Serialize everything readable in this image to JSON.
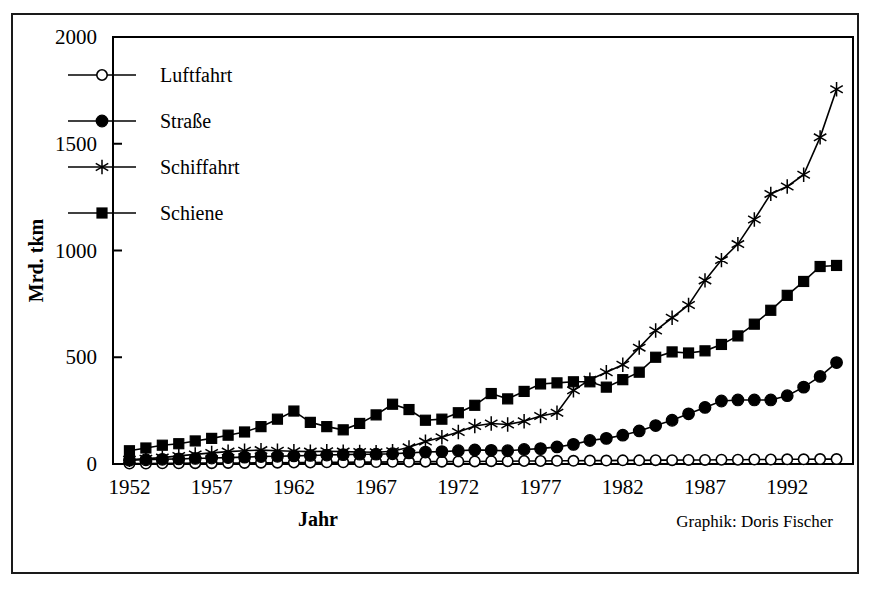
{
  "figure": {
    "credit": "Graphik: Doris Fischer"
  },
  "chart_data": {
    "type": "line",
    "title": "",
    "xlabel": "Jahr",
    "ylabel": "Mrd. tkm",
    "xlim": [
      1951,
      1996
    ],
    "ylim": [
      0,
      2000
    ],
    "xticks": [
      1952,
      1957,
      1962,
      1967,
      1972,
      1977,
      1982,
      1987,
      1992
    ],
    "xticklabels": [
      "1952",
      "1957",
      "1962",
      "1967",
      "1972",
      "1977",
      "1982",
      "1987",
      "1992"
    ],
    "yticks": [
      0,
      500,
      1000,
      1500,
      2000
    ],
    "yticklabels": [
      "0",
      "500",
      "1000",
      "1500",
      "2000"
    ],
    "grid": false,
    "legend_position": "upper left",
    "x": [
      1952,
      1953,
      1954,
      1955,
      1956,
      1957,
      1958,
      1959,
      1960,
      1961,
      1962,
      1963,
      1964,
      1965,
      1966,
      1967,
      1968,
      1969,
      1970,
      1971,
      1972,
      1973,
      1974,
      1975,
      1976,
      1977,
      1978,
      1979,
      1980,
      1981,
      1982,
      1983,
      1984,
      1985,
      1986,
      1987,
      1988,
      1989,
      1990,
      1991,
      1992,
      1993,
      1994,
      1995
    ],
    "series": [
      {
        "name": "Luftfahrt",
        "marker": "open-circle",
        "values": [
          2,
          2,
          3,
          3,
          4,
          4,
          5,
          5,
          6,
          6,
          7,
          7,
          8,
          8,
          9,
          9,
          10,
          10,
          11,
          11,
          12,
          12,
          13,
          13,
          14,
          14,
          15,
          15,
          16,
          16,
          17,
          17,
          18,
          18,
          19,
          19,
          20,
          20,
          21,
          21,
          22,
          22,
          23,
          23
        ]
      },
      {
        "name": "Straße",
        "marker": "filled-circle",
        "values": [
          18,
          20,
          22,
          24,
          26,
          28,
          30,
          32,
          35,
          36,
          38,
          40,
          42,
          44,
          46,
          46,
          48,
          52,
          56,
          58,
          62,
          66,
          64,
          62,
          68,
          72,
          80,
          92,
          110,
          120,
          135,
          155,
          180,
          205,
          235,
          265,
          295,
          300,
          300,
          300,
          320,
          360,
          410,
          475
        ]
      },
      {
        "name": "Schiffahrt",
        "marker": "star",
        "values": [
          20,
          25,
          30,
          38,
          45,
          52,
          58,
          62,
          65,
          62,
          60,
          58,
          60,
          58,
          56,
          55,
          60,
          78,
          105,
          125,
          150,
          178,
          190,
          185,
          200,
          225,
          240,
          345,
          395,
          430,
          465,
          545,
          625,
          685,
          745,
          860,
          955,
          1030,
          1145,
          1265,
          1300,
          1355,
          1530,
          1755
        ]
      },
      {
        "name": "Schiene",
        "marker": "filled-square",
        "values": [
          62,
          75,
          88,
          95,
          108,
          120,
          135,
          150,
          175,
          210,
          248,
          195,
          175,
          160,
          190,
          230,
          280,
          255,
          205,
          210,
          240,
          275,
          330,
          305,
          340,
          375,
          380,
          385,
          385,
          360,
          395,
          430,
          500,
          525,
          520,
          530,
          560,
          600,
          655,
          720,
          790,
          855,
          925,
          930
        ]
      }
    ]
  }
}
